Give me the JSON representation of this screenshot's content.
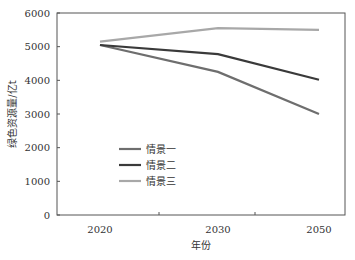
{
  "chart_data": {
    "type": "line",
    "title": "",
    "xlabel": "年份",
    "ylabel": "绿色资源量/亿t",
    "categories": [
      "2020",
      "2030",
      "2050"
    ],
    "ylim": [
      0,
      6000
    ],
    "yticks": [
      0,
      1000,
      2000,
      3000,
      4000,
      5000,
      6000
    ],
    "grid": false,
    "legend_position": "lower-left inside plot",
    "series": [
      {
        "name": "情景一",
        "values": [
          5050,
          4250,
          3000
        ],
        "color": "#6e6e6e"
      },
      {
        "name": "情景二",
        "values": [
          5050,
          4780,
          4020
        ],
        "color": "#3a3a3a"
      },
      {
        "name": "情景三",
        "values": [
          5150,
          5550,
          5500
        ],
        "color": "#a8a8a8"
      }
    ]
  }
}
